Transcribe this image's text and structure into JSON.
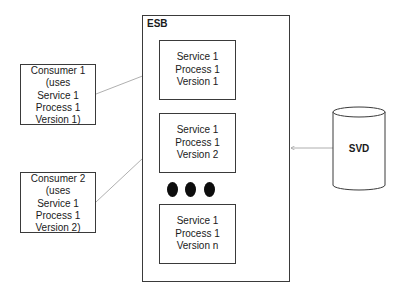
{
  "esb": {
    "label": "ESB",
    "services": [
      {
        "lines": [
          "Service 1",
          "Process 1",
          "Version 1"
        ]
      },
      {
        "lines": [
          "Service 1",
          "Process 1",
          "Version 2"
        ]
      },
      {
        "lines": [
          "Service 1",
          "Process 1",
          "Version n"
        ]
      }
    ],
    "ellipsis_dots": 3
  },
  "consumers": [
    {
      "lines": [
        "Consumer 1",
        "(uses",
        "Service 1",
        "Process 1",
        "Version 1)"
      ]
    },
    {
      "lines": [
        "Consumer 2",
        "(uses",
        "Service 1",
        "Process 1",
        "Version 2)"
      ]
    }
  ],
  "svd": {
    "label": "SVD"
  },
  "connections": [
    {
      "from": "Consumer 1",
      "to": "Service 1 Process 1 Version 1"
    },
    {
      "from": "Consumer 2",
      "to": "Service 1 Process 1 Version 2"
    },
    {
      "from": "SVD",
      "to": "ESB"
    }
  ],
  "colors": {
    "stroke": "#3a3a3a",
    "arrow": "#9a9a9a",
    "dot": "#0d0d0d"
  }
}
